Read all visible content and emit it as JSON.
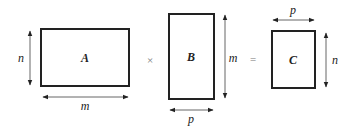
{
  "diagram": {
    "matrices": [
      {
        "name": "A",
        "rows_label": "n",
        "cols_label": "m"
      },
      {
        "name": "B",
        "rows_label": "m",
        "cols_label": "p"
      },
      {
        "name": "C",
        "rows_label": "n",
        "cols_label": "p"
      }
    ],
    "operators": {
      "multiply": "×",
      "equals": "="
    },
    "colors": {
      "stroke": "#222222",
      "arrow": "#555555",
      "background": "#ffffff"
    }
  }
}
